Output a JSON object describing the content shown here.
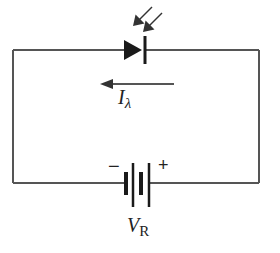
{
  "diagram": {
    "type": "circuit-schematic",
    "components": [
      {
        "id": "photodiode",
        "kind": "photodiode",
        "position": "top wire, center",
        "incident_light_arrows": 2
      },
      {
        "id": "battery",
        "kind": "battery",
        "position": "bottom wire, center",
        "cells": 2
      }
    ],
    "labels": {
      "current": {
        "symbol": "I",
        "subscript": "λ"
      },
      "voltage": {
        "symbol": "V",
        "subscript": "R"
      },
      "battery_negative": "−",
      "battery_positive": "+"
    },
    "current_arrow": {
      "direction": "left"
    },
    "colors": {
      "wire": "#555555",
      "component": "#1a1a1a",
      "background": "#ffffff"
    }
  }
}
